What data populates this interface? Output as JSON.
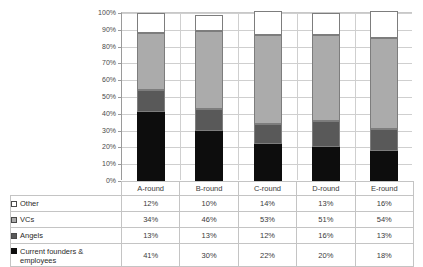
{
  "chart_data": {
    "type": "bar",
    "stacked": true,
    "percent_stacked": true,
    "title": "",
    "xlabel": "",
    "ylabel": "",
    "ylim": [
      0,
      100
    ],
    "ytick_labels": [
      "100%",
      "90%",
      "80%",
      "70%",
      "60%",
      "50%",
      "40%",
      "30%",
      "20%",
      "10%",
      "0%"
    ],
    "ytick_values": [
      100,
      90,
      80,
      70,
      60,
      50,
      40,
      30,
      20,
      10,
      0
    ],
    "grid": true,
    "legend_position": "table-left",
    "categories": [
      "A-round",
      "B-round",
      "C-round",
      "D-round",
      "E-round"
    ],
    "stack_order_bottom_to_top": [
      "Current founders & employees",
      "Angels",
      "VCs",
      "Other"
    ],
    "series": [
      {
        "name": "Other",
        "color": "#ffffff",
        "values": [
          12,
          10,
          14,
          13,
          16
        ],
        "labels": [
          "12%",
          "10%",
          "14%",
          "13%",
          "16%"
        ]
      },
      {
        "name": "VCs",
        "color": "#ababab",
        "values": [
          34,
          46,
          53,
          51,
          54
        ],
        "labels": [
          "34%",
          "46%",
          "53%",
          "51%",
          "54%"
        ]
      },
      {
        "name": "Angels",
        "color": "#595959",
        "values": [
          13,
          13,
          12,
          16,
          13
        ],
        "labels": [
          "13%",
          "13%",
          "12%",
          "16%",
          "13%"
        ]
      },
      {
        "name": "Current founders & employees",
        "color": "#0d0d0d",
        "values": [
          41,
          30,
          22,
          20,
          18
        ],
        "labels": [
          "41%",
          "30%",
          "22%",
          "20%",
          "18%"
        ]
      }
    ]
  },
  "table": {
    "corner_label": "",
    "column_headers": [
      "A-round",
      "B-round",
      "C-round",
      "D-round",
      "E-round"
    ],
    "rows": [
      {
        "legend_label": "Other",
        "legend_label_line1": "Other",
        "legend_label_line2": "",
        "swatch": "white-square-icon",
        "values": [
          "12%",
          "10%",
          "14%",
          "13%",
          "16%"
        ]
      },
      {
        "legend_label": "VCs",
        "legend_label_line1": "VCs",
        "legend_label_line2": "",
        "swatch": "light-gray-square-icon",
        "values": [
          "34%",
          "46%",
          "53%",
          "51%",
          "54%"
        ]
      },
      {
        "legend_label": "Angels",
        "legend_label_line1": "Angels",
        "legend_label_line2": "",
        "swatch": "dark-gray-square-icon",
        "values": [
          "13%",
          "13%",
          "12%",
          "16%",
          "13%"
        ]
      },
      {
        "legend_label": "Current founders & employees",
        "legend_label_line1": "Current founders &",
        "legend_label_line2": "employees",
        "swatch": "black-square-icon",
        "values": [
          "41%",
          "30%",
          "22%",
          "20%",
          "18%"
        ]
      }
    ]
  },
  "colors": {
    "other": "#ffffff",
    "vcs": "#ababab",
    "angels": "#595959",
    "founders": "#0d0d0d",
    "gridline": "#cfcfcf",
    "axis": "#9a9a9a",
    "table_border": "#c4c4c4",
    "text": "#3a3a3a",
    "background": "#ffffff"
  }
}
